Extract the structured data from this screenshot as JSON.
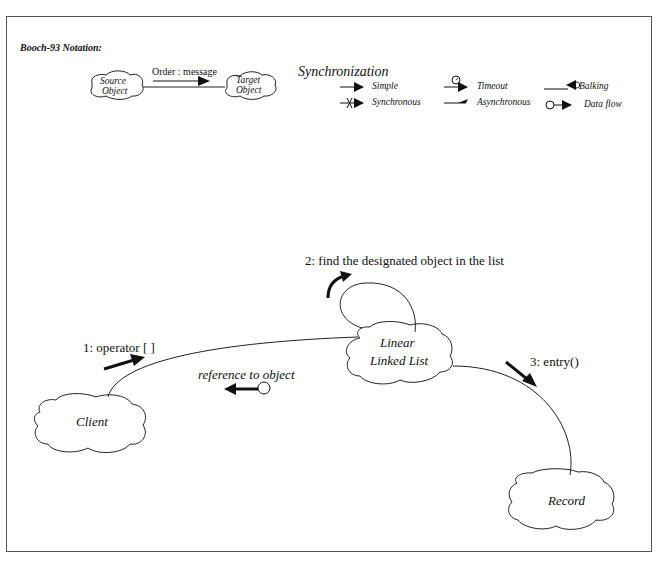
{
  "notation": {
    "title": "Booch-93 Notation:",
    "source_object": "Source\nObject",
    "source_line1": "Source",
    "source_line2": "Object",
    "target_line1": "Target",
    "target_line2": "Object",
    "message_label": "Order : message"
  },
  "synchronization": {
    "heading": "Synchronization",
    "items": [
      {
        "label": "Simple",
        "icon": "simple-arrow-icon"
      },
      {
        "label": "Synchronous",
        "icon": "synchronous-arrow-icon"
      },
      {
        "label": "Timeout",
        "icon": "timeout-arrow-icon"
      },
      {
        "label": "Asynchronous",
        "icon": "asynchronous-arrow-icon"
      },
      {
        "label": "Balking",
        "icon": "balking-arrow-icon"
      },
      {
        "label": "Data flow",
        "icon": "data-flow-arrow-icon"
      }
    ]
  },
  "diagram": {
    "objects": {
      "client": "Client",
      "list_line1": "Linear",
      "list_line2": "Linked List",
      "record": "Record"
    },
    "messages": {
      "m1": "1: operator [ ]",
      "m2": "2: find the designated object in the list",
      "m3": "3: entry()",
      "return": "reference to object"
    }
  }
}
